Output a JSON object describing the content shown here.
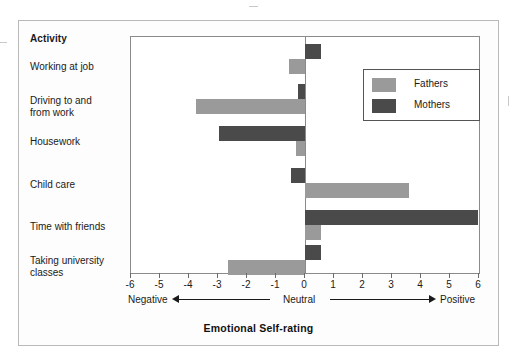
{
  "figure": {
    "column_header": "Activity",
    "axis_title": "Emotional Self-rating",
    "axis_words": {
      "negative": "Negative",
      "neutral": "Neutral",
      "positive": "Positive"
    },
    "legend": {
      "fathers": "Fathers",
      "mothers": "Mothers"
    },
    "colors": {
      "fathers": "#9a9a9a",
      "mothers": "#4a4a4a",
      "axis": "#8a8a8a",
      "text": "#1a1a1a"
    }
  },
  "chart_data": {
    "type": "bar",
    "orientation": "horizontal",
    "title": "",
    "xlabel": "Emotional Self-rating",
    "ylabel": "Activity",
    "xlim": [
      -6,
      6
    ],
    "xticks": [
      -6,
      -5,
      -4,
      -3,
      -2,
      -1,
      0,
      1,
      2,
      3,
      4,
      5,
      6
    ],
    "xtick_labels": [
      "-6",
      "-5",
      "-4",
      "-3",
      "-2",
      "-1",
      "0",
      "1",
      "2",
      "3",
      "4",
      "5",
      "6"
    ],
    "grid": false,
    "legend_position": "upper right",
    "categories": [
      "Working at job",
      "Driving to and from work",
      "Housework",
      "Child care",
      "Time with friends",
      "Taking university classes"
    ],
    "category_label_lines": [
      [
        "Working at job"
      ],
      [
        "Driving to and",
        "from work"
      ],
      [
        "Housework"
      ],
      [
        "Child care"
      ],
      [
        "Time with friends"
      ],
      [
        "Taking university",
        "classes"
      ]
    ],
    "series": [
      {
        "name": "Fathers",
        "color": "#9a9a9a",
        "values": [
          -0.55,
          -3.75,
          -0.3,
          3.6,
          0.55,
          -2.65
        ]
      },
      {
        "name": "Mothers",
        "color": "#4a4a4a",
        "values": [
          0.55,
          -0.25,
          -2.95,
          -0.5,
          5.95,
          0.55
        ]
      }
    ],
    "annotations": [
      {
        "text": "Negative",
        "position": "axis-left"
      },
      {
        "text": "Neutral",
        "position": "axis-center-zero"
      },
      {
        "text": "Positive",
        "position": "axis-right"
      }
    ]
  }
}
